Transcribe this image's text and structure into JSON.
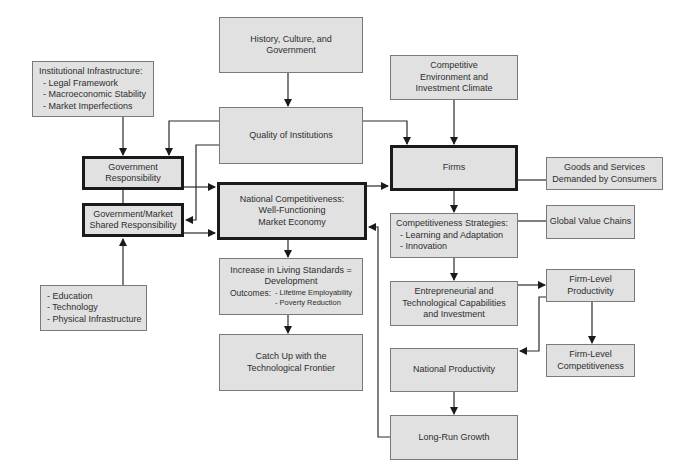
{
  "diagram": {
    "nodes": {
      "history": {
        "lines": [
          "History, Culture, and",
          "Government"
        ]
      },
      "quality": {
        "lines": [
          "Quality of Institutions"
        ]
      },
      "institutional": {
        "title": "Institutional Infrastructure:",
        "items": [
          "- Legal Framework",
          "- Macroeconomic Stability",
          "- Market Imperfections"
        ]
      },
      "gov_resp": {
        "lines": [
          "Government",
          "Responsibility"
        ]
      },
      "shared_resp": {
        "lines": [
          "Government/Market",
          "Shared Responsibility"
        ]
      },
      "national_comp": {
        "lines": [
          "National Competitiveness:",
          "Well-Functioning",
          "Market Economy"
        ]
      },
      "education": {
        "items": [
          "- Education",
          "- Technology",
          "- Physical Infrastructure"
        ]
      },
      "living": {
        "lines": [
          "Increase in Living Standards =",
          "Development"
        ],
        "outcomes_label": "Outcomes:",
        "outcomes": [
          "- Lifetime Employability",
          "- Poverty Reduction"
        ]
      },
      "catchup": {
        "lines": [
          "Catch Up with the",
          "Technological Frontier"
        ]
      },
      "competitive_env": {
        "lines": [
          "Competitive",
          "Environment and",
          "Investment Climate"
        ]
      },
      "firms": {
        "lines": [
          "Firms"
        ]
      },
      "goods": {
        "lines": [
          "Goods and Services",
          "Demanded by Consumers"
        ]
      },
      "strategies": {
        "title": "Competitiveness Strategies:",
        "items": [
          "- Learning and Adaptation",
          "- Innovation"
        ]
      },
      "gvc": {
        "lines": [
          "Global Value Chains"
        ]
      },
      "entrepreneurial": {
        "lines": [
          "Entrepreneurial and",
          "Technological Capabilities",
          "and Investment"
        ]
      },
      "firm_prod": {
        "lines": [
          "Firm-Level",
          "Productivity"
        ]
      },
      "firm_comp": {
        "lines": [
          "Firm-Level",
          "Competitiveness"
        ]
      },
      "nat_prod": {
        "lines": [
          "National Productivity"
        ]
      },
      "growth": {
        "lines": [
          "Long-Run Growth"
        ]
      }
    },
    "edges": [
      [
        "history",
        "quality"
      ],
      [
        "quality",
        "gov_resp"
      ],
      [
        "quality",
        "shared_resp"
      ],
      [
        "quality",
        "firms"
      ],
      [
        "institutional",
        "gov_resp"
      ],
      [
        "education",
        "shared_resp"
      ],
      [
        "gov_resp",
        "national_comp"
      ],
      [
        "shared_resp",
        "national_comp"
      ],
      [
        "national_comp",
        "firms"
      ],
      [
        "national_comp",
        "living"
      ],
      [
        "living",
        "catchup"
      ],
      [
        "competitive_env",
        "firms"
      ],
      [
        "goods",
        "firms"
      ],
      [
        "firms",
        "strategies"
      ],
      [
        "gvc",
        "strategies"
      ],
      [
        "strategies",
        "entrepreneurial"
      ],
      [
        "entrepreneurial",
        "firm_prod"
      ],
      [
        "firm_prod",
        "firm_comp"
      ],
      [
        "firm_prod",
        "nat_prod"
      ],
      [
        "nat_prod",
        "growth"
      ],
      [
        "growth",
        "national_comp"
      ]
    ],
    "colors": {
      "box_fill": "#e1e1e1",
      "box_border": "#7a7a7a",
      "thick_border": "#1a1a1a",
      "line": "#222222",
      "text": "#2e2e2e"
    }
  }
}
